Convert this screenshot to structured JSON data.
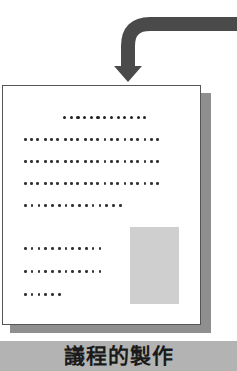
{
  "diagram": {
    "type": "document-with-incoming-arrow",
    "arrow": {
      "direction": "from-right-curving-down",
      "color": "#4a4a4a"
    },
    "document": {
      "title_line": {
        "dots": 13
      },
      "body_lines": [
        {
          "groups": 7,
          "dots_per_group": 3
        },
        {
          "groups": 7,
          "dots_per_group": 3
        },
        {
          "groups": 7,
          "dots_per_group": 3
        },
        {
          "dots": 15
        }
      ],
      "side_lines": [
        {
          "dots": 12
        },
        {
          "dots": 12
        },
        {
          "dots": 6
        }
      ],
      "image_placeholder": {
        "color": "#cfcfcf"
      },
      "shadow_color": "#8f8f8f",
      "border_color": "#555555"
    },
    "caption": {
      "text": "議程的製作",
      "background": "#b3b3b3"
    }
  }
}
